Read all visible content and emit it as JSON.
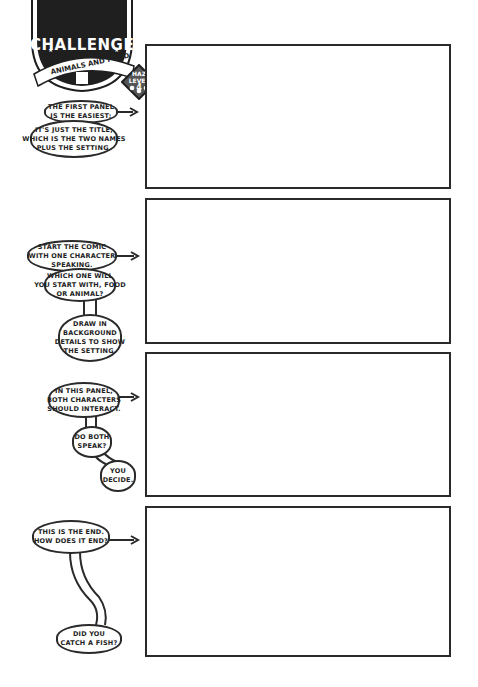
{
  "badge": {
    "title": "CHALLENGE",
    "subtitle": "ANIMALS AND FOOD",
    "hazard": {
      "line1": "HAZ",
      "line2": "LEVEL",
      "level": "4"
    }
  },
  "panels": [
    {
      "index": 1
    },
    {
      "index": 2
    },
    {
      "index": 3
    },
    {
      "index": 4
    }
  ],
  "bubbles": {
    "p1_a": [
      "THE FIRST PANEL",
      "IS THE EASIEST:"
    ],
    "p1_b": [
      "IT'S JUST THE TITLE,",
      "WHICH IS THE TWO NAMES",
      "PLUS THE SETTING."
    ],
    "p2_a": [
      "START THE COMIC",
      "WITH ONE CHARACTER",
      "SPEAKING."
    ],
    "p2_b": [
      "WHICH ONE WILL",
      "YOU START WITH, FOOD",
      "OR ANIMAL?"
    ],
    "p2_c": [
      "DRAW IN",
      "BACKGROUND",
      "DETAILS TO SHOW",
      "THE SETTING."
    ],
    "p3_a": [
      "IN THIS PANEL,",
      "BOTH CHARACTERS",
      "SHOULD INTERACT."
    ],
    "p3_b": [
      "DO BOTH",
      "SPEAK?"
    ],
    "p3_c": [
      "YOU",
      "DECIDE."
    ],
    "p4_a": [
      "THIS IS THE END.",
      "HOW DOES IT END?"
    ],
    "p4_b": [
      "DID YOU",
      "CATCH A FISH?"
    ]
  },
  "colors": {
    "ink": "#2a2a2a",
    "badge_fill": "#1f1f1f",
    "paper": "#ffffff",
    "haz_fill": "#555555"
  }
}
